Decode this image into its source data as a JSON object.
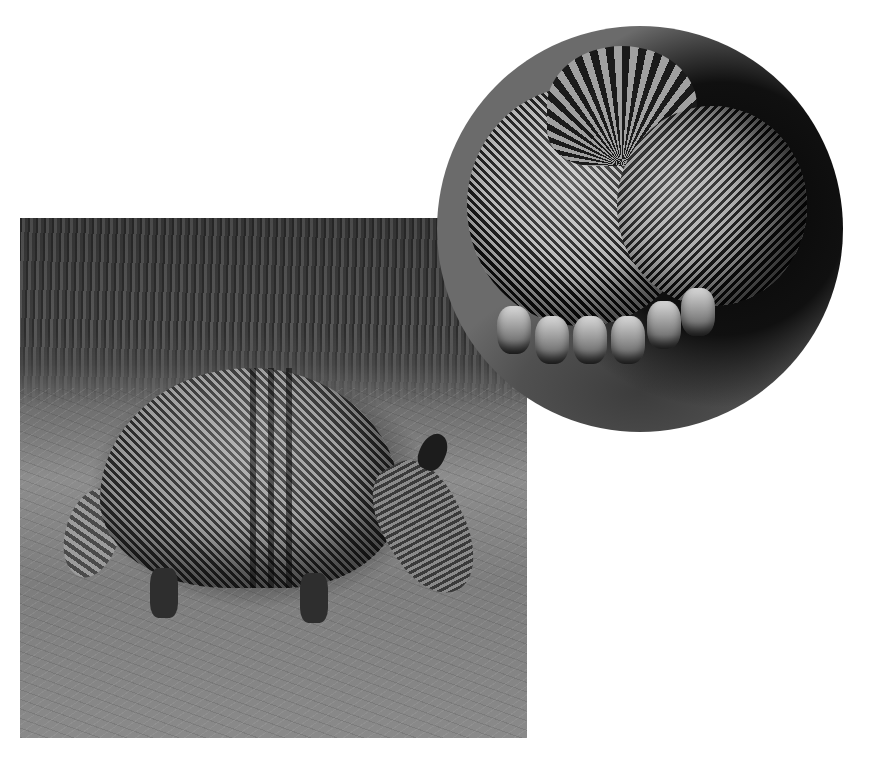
{
  "scene": {
    "description": "Two photographs of a nine-banded armadillo on a white background",
    "background_color": "#ffffff",
    "main_photo": {
      "subject": "armadillo foraging on sandy ground with tall grass behind",
      "tone": "black-and-white"
    },
    "inset_photo": {
      "subject": "armadillo curled into a ball showing banded shell and tail",
      "shape": "circle",
      "tone": "black-and-white"
    }
  }
}
